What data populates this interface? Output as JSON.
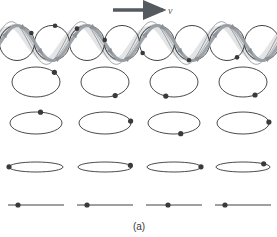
{
  "figure": {
    "caption": "(a)",
    "velocity_label": "v",
    "velocity_arrow": "right-arrow-icon",
    "colors": {
      "ink": "#2b2b2b",
      "wave_gray": "#9aa0a6",
      "wave_fill": "#d9dbdd",
      "marker": "#3a3a3a",
      "caption": "#3a3a3a"
    }
  },
  "chart_data": {
    "type": "scatter",
    "title": "",
    "subtitle": "",
    "xlabel": "",
    "ylabel": "",
    "annotations": [
      {
        "text": "v",
        "role": "wave-propagation-velocity",
        "x": 168,
        "y": 11
      },
      {
        "text": "(a)",
        "role": "figure-label",
        "x": 139,
        "y": 230
      }
    ],
    "grid": false,
    "legend_position": "none",
    "rows": [
      {
        "row_index": 0,
        "label": "surface-orbits",
        "shape": "circle",
        "cy": 43,
        "rx": 17.5,
        "ry": 17.5,
        "count": 8,
        "centers_x": [
          17,
          52,
          87,
          122,
          157,
          192,
          227,
          262
        ],
        "marker_angles_deg": [
          35,
          80,
          125,
          170,
          215,
          260,
          305,
          350
        ],
        "has_wave_overlay": true
      },
      {
        "row_index": 1,
        "label": "depth-1-orbits",
        "shape": "ellipse",
        "cy": 82,
        "rx": 24,
        "ry": 15,
        "count": 4,
        "centers_x": [
          36,
          105,
          174,
          243
        ],
        "marker_angles_deg": [
          40,
          295,
          250,
          300
        ],
        "has_wave_overlay": false
      },
      {
        "row_index": 2,
        "label": "depth-2-orbits",
        "shape": "ellipse",
        "cy": 123,
        "rx": 26,
        "ry": 11,
        "count": 4,
        "centers_x": [
          36,
          105,
          174,
          243
        ],
        "marker_angles_deg": [
          80,
          10,
          285,
          5
        ],
        "has_wave_overlay": false
      },
      {
        "row_index": 3,
        "label": "depth-3-orbits",
        "shape": "ellipse",
        "cy": 167,
        "rx": 27,
        "ry": 5,
        "count": 4,
        "centers_x": [
          36,
          105,
          174,
          243
        ],
        "marker_angles_deg": [
          178,
          20,
          2,
          40
        ],
        "has_wave_overlay": false
      },
      {
        "row_index": 4,
        "label": "depth-4-lines",
        "shape": "line",
        "cy": 205,
        "rx": 28,
        "ry": 0,
        "count": 4,
        "centers_x": [
          36,
          105,
          174,
          243
        ],
        "marker_angles_deg": [
          180,
          180,
          180,
          180
        ],
        "marker_offsets_x": [
          -18,
          -18,
          -6,
          -18
        ],
        "has_wave_overlay": false
      }
    ],
    "wave": {
      "role": "travelling-wave-overlay",
      "wavelength": 70,
      "amplitude": 17.5,
      "baseline_y": 43,
      "x_start": -6,
      "x_end": 283,
      "envelope_top_y": 22,
      "phase_deg": 0,
      "direction": "right",
      "velocity_symbol": "v",
      "arrow": {
        "x1": 113,
        "y1": 10,
        "x2": 163,
        "y2": 10
      }
    }
  }
}
